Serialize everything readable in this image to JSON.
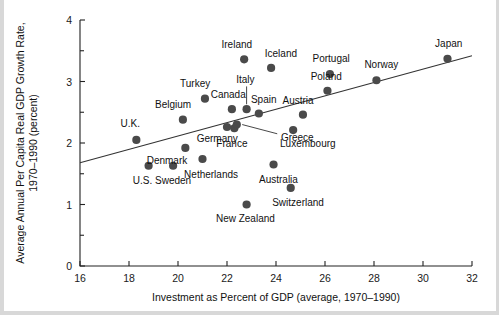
{
  "chart_data": {
    "type": "scatter",
    "title": "",
    "xlabel": "Investment as Percent of GDP (average, 1970–1990)",
    "ylabel": "Average Annual Per Capita Real GDP Growth Rate, 1970–1990 (percent)",
    "xlim": [
      16,
      32
    ],
    "ylim": [
      0,
      4
    ],
    "xticks": [
      16,
      18,
      20,
      22,
      24,
      26,
      28,
      30,
      32
    ],
    "xticklabels": [
      "16",
      "18",
      "20",
      "22",
      "24",
      "26",
      "28",
      "30",
      "32"
    ],
    "yticks": [
      0,
      1,
      2,
      3,
      4
    ],
    "yticklabels": [
      "0",
      "1",
      "2",
      "3",
      "4"
    ],
    "y_minor_ticks": [
      0.5,
      1.5,
      2.5,
      3.5
    ],
    "grid": false,
    "legend": "none",
    "points": [
      {
        "label": "U.S.",
        "x": 18.8,
        "y": 1.63,
        "lx": 18.55,
        "ly": 1.37,
        "anchor": "middle"
      },
      {
        "label": "U.K.",
        "x": 18.3,
        "y": 2.05,
        "lx": 18.05,
        "ly": 2.3,
        "anchor": "middle"
      },
      {
        "label": "Denmark",
        "x": 20.3,
        "y": 1.92,
        "lx": 19.55,
        "ly": 1.7,
        "anchor": "middle"
      },
      {
        "label": "Sweden",
        "x": 19.8,
        "y": 1.63,
        "lx": 19.8,
        "ly": 1.37,
        "anchor": "middle"
      },
      {
        "label": "Netherlands",
        "x": 21.0,
        "y": 1.74,
        "lx": 21.35,
        "ly": 1.48,
        "anchor": "middle"
      },
      {
        "label": "Belgium",
        "x": 20.2,
        "y": 2.38,
        "lx": 19.8,
        "ly": 2.62,
        "anchor": "middle"
      },
      {
        "label": "Turkey",
        "x": 21.1,
        "y": 2.72,
        "lx": 20.7,
        "ly": 2.96,
        "anchor": "middle"
      },
      {
        "label": "Germany",
        "x": 22.0,
        "y": 2.26,
        "lx": 21.6,
        "ly": 2.06,
        "anchor": "middle"
      },
      {
        "label": "Canada",
        "x": 22.2,
        "y": 2.55,
        "lx": 22.05,
        "ly": 2.78,
        "anchor": "middle"
      },
      {
        "label": "France",
        "x": 22.3,
        "y": 2.24,
        "lx": 22.2,
        "ly": 1.97,
        "anchor": "middle"
      },
      {
        "label": "Greece",
        "x": 22.4,
        "y": 2.3,
        "lx": 24.2,
        "ly": 2.08,
        "anchor": "start"
      },
      {
        "label": "Italy",
        "x": 22.8,
        "y": 2.55,
        "lx": 22.75,
        "ly": 3.02,
        "anchor": "middle"
      },
      {
        "label": "Spain",
        "x": 23.3,
        "y": 2.48,
        "lx": 23.5,
        "ly": 2.7,
        "anchor": "middle"
      },
      {
        "label": "New Zealand",
        "x": 22.8,
        "y": 1.0,
        "lx": 22.75,
        "ly": 0.76,
        "anchor": "middle"
      },
      {
        "label": "Ireland",
        "x": 22.7,
        "y": 3.36,
        "lx": 22.4,
        "ly": 3.58,
        "anchor": "middle"
      },
      {
        "label": "Iceland",
        "x": 23.8,
        "y": 3.22,
        "lx": 24.2,
        "ly": 3.44,
        "anchor": "middle"
      },
      {
        "label": "Australia",
        "x": 23.9,
        "y": 1.65,
        "lx": 24.1,
        "ly": 1.4,
        "anchor": "middle"
      },
      {
        "label": "Switzerland",
        "x": 24.6,
        "y": 1.27,
        "lx": 24.9,
        "ly": 1.02,
        "anchor": "middle"
      },
      {
        "label": "Luxembourg",
        "x": 24.7,
        "y": 2.21,
        "lx": 25.3,
        "ly": 1.98,
        "anchor": "middle"
      },
      {
        "label": "Austria",
        "x": 25.1,
        "y": 2.46,
        "lx": 24.9,
        "ly": 2.68,
        "anchor": "middle"
      },
      {
        "label": "Poland",
        "x": 26.1,
        "y": 2.85,
        "lx": 26.05,
        "ly": 3.06,
        "anchor": "middle"
      },
      {
        "label": "Portugal",
        "x": 26.2,
        "y": 3.12,
        "lx": 26.25,
        "ly": 3.36,
        "anchor": "middle"
      },
      {
        "label": "Norway",
        "x": 28.1,
        "y": 3.02,
        "lx": 28.3,
        "ly": 3.26,
        "anchor": "middle"
      },
      {
        "label": "Japan",
        "x": 31.0,
        "y": 3.37,
        "lx": 31.05,
        "ly": 3.6,
        "anchor": "middle"
      }
    ],
    "trendline": {
      "x0": 16.0,
      "y0": 1.68,
      "x1": 32.0,
      "y1": 3.42
    },
    "leaders": [
      {
        "label": "Italy",
        "x0": 22.8,
        "y0": 2.92,
        "x1": 22.8,
        "y1": 2.63
      },
      {
        "label": "Greece",
        "x0": 24.05,
        "y0": 2.15,
        "x1": 22.62,
        "y1": 2.3
      }
    ]
  }
}
